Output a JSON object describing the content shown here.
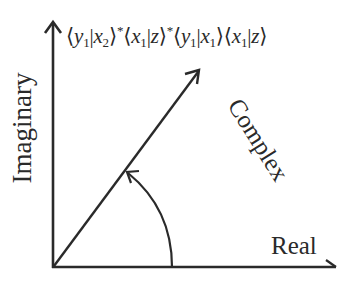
{
  "diagram": {
    "formula": {
      "parts": [
        {
          "open": "⟨",
          "a": "y",
          "a_sub": "1",
          "sep": "|",
          "b": "x",
          "b_sub": "2",
          "close": "⟩",
          "sup": "*"
        },
        {
          "open": "⟨",
          "a": "x",
          "a_sub": "1",
          "sep": "|",
          "b": "z",
          "b_sub": "",
          "close": "⟩",
          "sup": "*"
        },
        {
          "open": "⟨",
          "a": "y",
          "a_sub": "1",
          "sep": "|",
          "b": "x",
          "b_sub": "1",
          "close": "⟩",
          "sup": ""
        },
        {
          "open": "⟨",
          "a": "x",
          "a_sub": "1",
          "sep": "|",
          "b": "z",
          "b_sub": "",
          "close": "⟩",
          "sup": ""
        }
      ],
      "text": "⟨y1|x2⟩*⟨x1|z⟩*⟨y1|x1⟩⟨x1|z⟩"
    },
    "axes": {
      "vertical_label": "Imaginary",
      "horizontal_label": "Real"
    },
    "vector_label": "Complex",
    "colors": {
      "stroke": "#2a2a2a",
      "background": "#ffffff"
    }
  }
}
